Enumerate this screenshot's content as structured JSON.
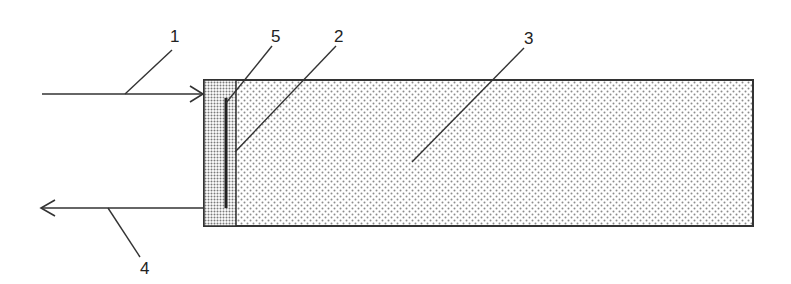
{
  "diagram": {
    "labels": {
      "input": "1",
      "inner_layer": "2",
      "body": "3",
      "output": "4",
      "electrode": "5"
    },
    "colors": {
      "stroke": "#333333",
      "background": "#ffffff",
      "dense_dot": "#7a7a7a",
      "sparse_dot": "#8c8c8c"
    }
  }
}
